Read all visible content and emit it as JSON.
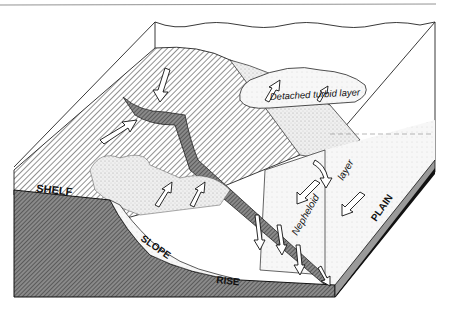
{
  "diagram": {
    "type": "block-diagram",
    "labels": {
      "shelf": "SHELF",
      "slope": "SLOPE",
      "rise": "RISE",
      "plain": "PLAIN",
      "detached_turbid_layer": "Detached turbid layer",
      "nepheloid": "Nepheloid",
      "layer": "layer"
    },
    "colors": {
      "background": "#ffffff",
      "ink": "#111111",
      "seabed_hatch": "#555555",
      "cross_section": "#6a6a6a",
      "canyon": "#7a7a7a",
      "stipple": "#d8d8d8",
      "plain_side": "#9a9a9a"
    }
  }
}
